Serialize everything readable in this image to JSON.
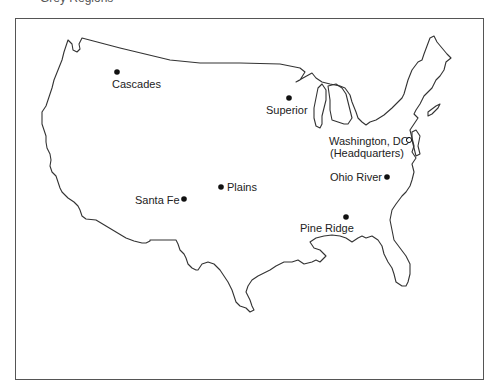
{
  "caption_fragment": "Grey Regions",
  "map": {
    "title": "United States outline map",
    "sites": [
      {
        "name": "Cascades",
        "marker": "filled-dot",
        "x": 117,
        "y": 72
      },
      {
        "name": "Superior",
        "marker": "filled-dot",
        "x": 289,
        "y": 98
      },
      {
        "name": "Washington, DC",
        "sub": "(Headquarters)",
        "marker": "open-circle",
        "x": 409,
        "y": 140
      },
      {
        "name": "Ohio River",
        "marker": "filled-dot",
        "x": 387,
        "y": 177
      },
      {
        "name": "Plains",
        "marker": "filled-dot",
        "x": 221,
        "y": 187
      },
      {
        "name": "Santa Fe",
        "marker": "filled-dot",
        "x": 184,
        "y": 199
      },
      {
        "name": "Pine Ridge",
        "marker": "filled-dot",
        "x": 346,
        "y": 217
      }
    ],
    "colors": {
      "outline": "#333333",
      "frame": "#555555",
      "marker": "#111111",
      "background": "#ffffff"
    }
  }
}
